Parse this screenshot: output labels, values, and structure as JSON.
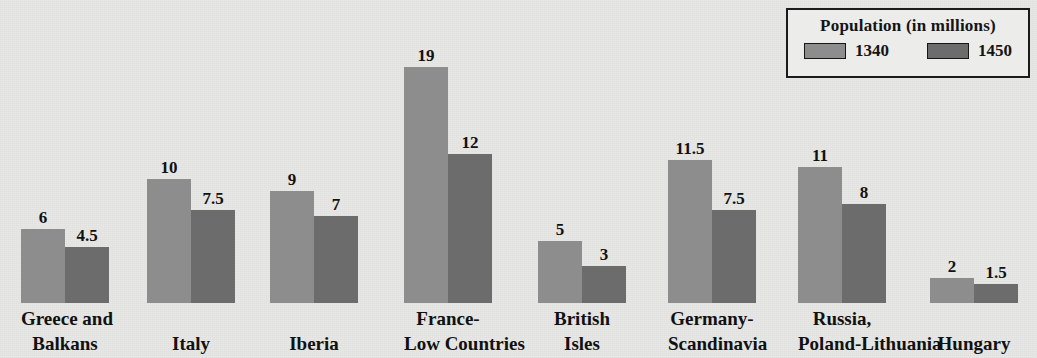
{
  "title_remnant": "",
  "legend": {
    "title": "Population (in millions)",
    "items": [
      {
        "label": "1340",
        "color": "#8d8d8d",
        "swatch_icon": "legend-swatch-icon"
      },
      {
        "label": "1450",
        "color": "#6c6c6c",
        "swatch_icon": "legend-swatch-icon"
      }
    ]
  },
  "chart_data": {
    "type": "bar",
    "title": "Population (in millions)",
    "xlabel": "",
    "ylabel": "Population (in millions)",
    "ylim": [
      0,
      20
    ],
    "grid": false,
    "legend_position": "top-right",
    "categories": [
      "Greece and Balkans",
      "Italy",
      "Iberia",
      "France-Low Countries",
      "British Isles",
      "Germany-Scandinavia",
      "Russia, Poland-Lithuania",
      "Hungary"
    ],
    "category_lines": [
      [
        "Greece and",
        "Balkans"
      ],
      [
        "Italy"
      ],
      [
        "Iberia"
      ],
      [
        "France-",
        "Low Countries"
      ],
      [
        "British",
        "Isles"
      ],
      [
        "Germany-",
        "Scandinavia"
      ],
      [
        "Russia,",
        "Poland-Lithuania"
      ],
      [
        "Hungary"
      ]
    ],
    "series": [
      {
        "name": "1340",
        "color": "#8d8d8d",
        "values": [
          6,
          10,
          9,
          19,
          5,
          11.5,
          11,
          2
        ]
      },
      {
        "name": "1450",
        "color": "#6c6c6c",
        "values": [
          4.5,
          7.5,
          7,
          12,
          3,
          7.5,
          8,
          1.5
        ]
      }
    ],
    "value_labels": [
      [
        "6",
        "4.5"
      ],
      [
        "10",
        "7.5"
      ],
      [
        "9",
        "7"
      ],
      [
        "19",
        "12"
      ],
      [
        "5",
        "3"
      ],
      [
        "11.5",
        "7.5"
      ],
      [
        "11",
        "8"
      ],
      [
        "2",
        "1.5"
      ]
    ]
  },
  "layout": {
    "baseline_y": 303,
    "px_per_unit": 12.4,
    "bar_width": 44,
    "group_left": [
      21,
      147,
      270,
      404,
      538,
      668,
      798,
      930
    ],
    "group_box_width": [
      110,
      100,
      100,
      130,
      110,
      125,
      140,
      100
    ],
    "label_offset": [
      -9,
      -11,
      -10,
      0,
      -8,
      -4,
      3,
      -1
    ]
  },
  "colors": {
    "paper": "#e8e8e6",
    "ink": "#111111",
    "series_1340": "#8d8d8d",
    "series_1450": "#6c6c6c",
    "legend_border": "#1b1b1b"
  }
}
